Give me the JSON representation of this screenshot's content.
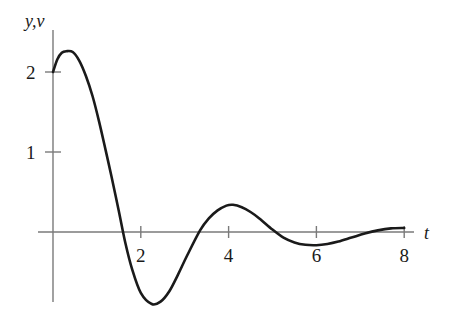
{
  "figure": {
    "background_color": "#ffffff",
    "curve_color": "#1a1a1a",
    "axis_color": "#7a7a7a",
    "text_color": "#1a1a1a"
  },
  "axes": {
    "y_axis_label": "y,v",
    "x_axis_label": "t",
    "x_ticks": [
      {
        "value": 2,
        "label": "2"
      },
      {
        "value": 4,
        "label": "4"
      },
      {
        "value": 6,
        "label": "6"
      },
      {
        "value": 8,
        "label": "8"
      }
    ],
    "y_ticks": [
      {
        "value": 1,
        "label": "1"
      },
      {
        "value": 2,
        "label": "2"
      }
    ]
  },
  "chart_data": {
    "type": "line",
    "title": "",
    "subtitle": "",
    "xlabel": "t",
    "ylabel": "y,v",
    "xlim": [
      -0.35,
      8.25
    ],
    "ylim": [
      -1.2,
      2.55
    ],
    "grid": false,
    "legend": null,
    "legend_position": "none",
    "x_tick_values": [
      2,
      4,
      6,
      8
    ],
    "x_tick_labels": [
      "2",
      "4",
      "6",
      "8"
    ],
    "y_tick_values": [
      1,
      2
    ],
    "y_tick_labels": [
      "1",
      "2"
    ],
    "annotations": [],
    "series": [
      {
        "name": "damped oscillation",
        "color": "#1a1a1a",
        "x": [
          0.0,
          0.1,
          0.2,
          0.3,
          0.45,
          0.6,
          0.75,
          0.9,
          1.05,
          1.2,
          1.33,
          1.5,
          1.65,
          1.8,
          2.0,
          2.25,
          2.45,
          2.65,
          2.85,
          3.05,
          3.35,
          3.55,
          3.75,
          3.95,
          4.1,
          4.3,
          4.5,
          4.7,
          5.0,
          5.25,
          5.5,
          5.75,
          6.0,
          6.25,
          6.5,
          6.8,
          7.1,
          7.4,
          7.7,
          8.0
        ],
        "y": [
          2.0,
          2.16,
          2.24,
          2.26,
          2.25,
          2.14,
          1.95,
          1.7,
          1.38,
          1.02,
          0.7,
          0.26,
          -0.14,
          -0.46,
          -0.76,
          -0.9,
          -0.87,
          -0.74,
          -0.53,
          -0.3,
          0.02,
          0.17,
          0.27,
          0.33,
          0.34,
          0.31,
          0.25,
          0.17,
          0.03,
          -0.07,
          -0.13,
          -0.16,
          -0.165,
          -0.15,
          -0.12,
          -0.07,
          -0.02,
          0.02,
          0.045,
          0.05
        ],
        "key_points": {
          "start": {
            "t": 0,
            "y": 2.0
          },
          "first_maximum": {
            "t": 0.35,
            "y": 2.26
          },
          "first_zero_crossing": {
            "t": 1.33,
            "y": 0
          },
          "first_minimum": {
            "t": 2.25,
            "y": -0.9
          },
          "second_zero_crossing": {
            "t": 3.35,
            "y": 0
          },
          "second_maximum": {
            "t": 4.1,
            "y": 0.34
          },
          "third_zero_crossing": {
            "t": 5.0,
            "y": 0
          },
          "second_minimum": {
            "t": 6.0,
            "y": -0.165
          },
          "fourth_zero_crossing": {
            "t": 7.3,
            "y": 0
          },
          "end": {
            "t": 8.0,
            "y": 0.05
          }
        }
      }
    ]
  },
  "geometry": {
    "origin_px": {
      "x": 53,
      "y": 232
    },
    "x_scale_px_per_unit": 43.9,
    "y_scale_px_per_unit": 80.0,
    "y_axis_top_px": 30,
    "y_axis_bottom_px": 302,
    "x_axis_left_px": 38,
    "x_axis_right_px": 414,
    "tick_half_len_px": 6
  }
}
